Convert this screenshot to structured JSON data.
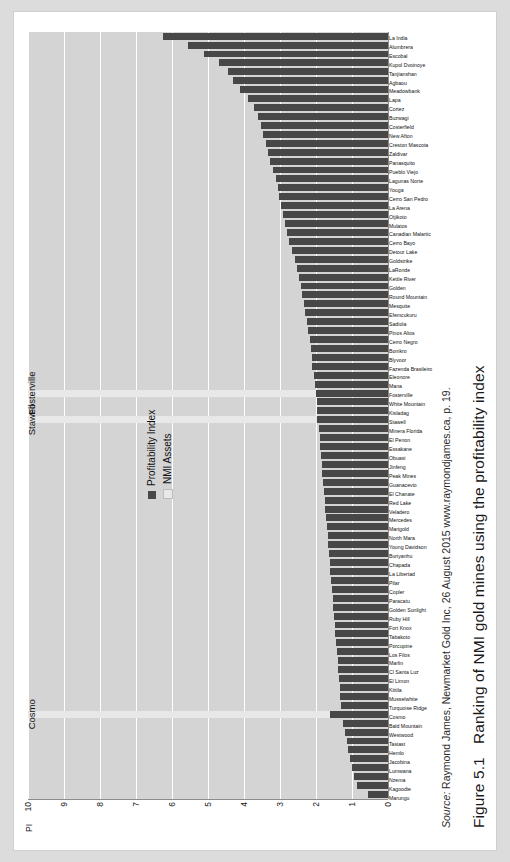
{
  "figure": {
    "caption_number": "Figure 5.1",
    "caption_text": "Ranking of NMI gold mines using the profitability index",
    "source_prefix": "Source:",
    "source_text": "Raymond James, Newmarket Gold Inc, 26 August 2015 www.raymondjames.ca, p. 19."
  },
  "legend": {
    "series1": "Profitability Index",
    "series2": "NMI Assets"
  },
  "highlights": [
    {
      "name": "Cosmo"
    },
    {
      "name": "Stawell"
    },
    {
      "name": "Fosterville"
    }
  ],
  "chart_data": {
    "type": "bar",
    "title": "Ranking of NMI gold mines using the profitability index",
    "xlabel": "",
    "ylabel": "PI",
    "ylim": [
      0,
      10
    ],
    "yticks": [
      "0",
      "1",
      "2",
      "3",
      "4",
      "5",
      "6",
      "7",
      "8",
      "9",
      "10"
    ],
    "grid": true,
    "legend_position": "inside-upper-left",
    "series": [
      {
        "name": "Profitability Index",
        "color": "#474747"
      },
      {
        "name": "NMI Assets",
        "color": "#e8e8e8"
      }
    ],
    "categories": [
      "Marungu",
      "Kagoodie",
      "Nzema",
      "Lumwana",
      "Jacobina",
      "Hemlo",
      "Tasiast",
      "Westwood",
      "Bald Mountain",
      "Cosmo",
      "Turquoise Ridge",
      "Musselwhite",
      "Kittila",
      "El Limon",
      "Cl Santa Luz",
      "Marlin",
      "Los Filos",
      "Porcupine",
      "Tabakoto",
      "Fort Knox",
      "Ruby Hill",
      "Golden Sunlight",
      "Paracatu",
      "Copler",
      "Pilar",
      "La Libertad",
      "Chapada",
      "Buriyanhu",
      "Young Davidson",
      "North Mara",
      "Marigold",
      "Mercedes",
      "Veladero",
      "Red Lake",
      "El Chanate",
      "Guanacevio",
      "Peak Mines",
      "Jinfeng",
      "Obuasi",
      "Essakane",
      "El Penon",
      "Minera Florida",
      "Stawell",
      "Kisladag",
      "White Mountain",
      "Fosterville",
      "Mana",
      "Eleonore",
      "Fazenda Brasileiro",
      "Blyvoor",
      "Bonikro",
      "Cerro Negro",
      "Pinos Altos",
      "Sadiola",
      "Efemcukuru",
      "Mesquite",
      "Round Mountain",
      "Golden",
      "Kettle River",
      "LaRonde",
      "Goldstrike",
      "Detour Lake",
      "Cerro Bayo",
      "Canadian Malartic",
      "Mulatos",
      "Otjikoto",
      "La Arena",
      "Cerro San Pedro",
      "Youga",
      "Lagunas Norte",
      "Pueblo Viejo",
      "Panasquito",
      "Zaldivar",
      "Creston Mascota",
      "New Afton",
      "Costerfield",
      "Buzwagi",
      "Cortez",
      "Lapa",
      "Meadowbank",
      "Agbaou",
      "Tanjianshan",
      "Kupol Dvoinoye",
      "Escobal",
      "Alumbrera",
      "La India"
    ],
    "values": [
      0.55,
      0.85,
      0.95,
      1.0,
      1.05,
      1.1,
      1.15,
      1.2,
      1.25,
      1.6,
      1.3,
      1.32,
      1.34,
      1.36,
      1.38,
      1.4,
      1.42,
      1.44,
      1.46,
      1.48,
      1.5,
      1.52,
      1.54,
      1.56,
      1.58,
      1.6,
      1.62,
      1.64,
      1.66,
      1.68,
      1.7,
      1.72,
      1.74,
      1.76,
      1.78,
      1.8,
      1.82,
      1.84,
      1.86,
      1.88,
      1.9,
      1.92,
      1.98,
      1.96,
      1.98,
      2.0,
      2.02,
      2.06,
      2.1,
      2.12,
      2.14,
      2.18,
      2.22,
      2.26,
      2.3,
      2.34,
      2.38,
      2.42,
      2.46,
      2.52,
      2.58,
      2.66,
      2.74,
      2.8,
      2.86,
      2.92,
      2.98,
      3.02,
      3.06,
      3.12,
      3.2,
      3.28,
      3.34,
      3.4,
      3.46,
      3.54,
      3.62,
      3.72,
      3.88,
      4.1,
      4.3,
      4.45,
      4.7,
      5.1,
      5.55,
      6.25
    ],
    "nmi_assets": [
      {
        "category": "Cosmo",
        "value": 10.0
      },
      {
        "category": "Stawell",
        "value": 10.0
      },
      {
        "category": "Fosterville",
        "value": 10.0
      }
    ]
  }
}
